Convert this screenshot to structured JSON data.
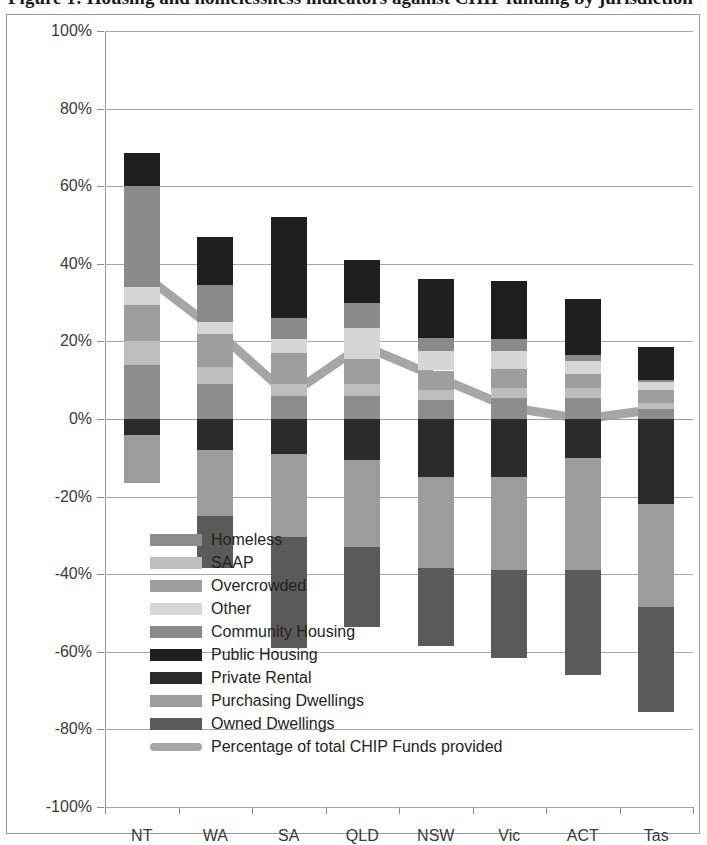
{
  "title": "Figure 1: Housing and homelessness indicators against CHIP funding by jurisdiction",
  "chart_data": {
    "type": "bar",
    "subtype": "stacked-bar-with-line",
    "title": "Housing and homelessness indicators against CHIP funding by jurisdiction",
    "xlabel": "",
    "ylabel": "",
    "ylim": [
      -100,
      100
    ],
    "ytick_values": [
      100,
      80,
      60,
      40,
      20,
      0,
      -20,
      -40,
      -60,
      -80,
      -100
    ],
    "ytick_labels": [
      "100%",
      "80%",
      "60%",
      "40%",
      "20%",
      "0%",
      "-20%",
      "-40%",
      "-60%",
      "-80%",
      "-100%"
    ],
    "grid": true,
    "legend_position": "inside-lower-left",
    "categories": [
      "NT",
      "WA",
      "SA",
      "QLD",
      "NSW",
      "Vic",
      "ACT",
      "Tas"
    ],
    "series": [
      {
        "name": "Homeless",
        "color": "#8c8c8c",
        "values": [
          14.0,
          9.0,
          6.0,
          6.0,
          5.0,
          5.5,
          5.5,
          2.5
        ]
      },
      {
        "name": "SAAP",
        "color": "#bdbdbd",
        "values": [
          6.0,
          4.5,
          3.0,
          3.0,
          2.5,
          2.5,
          2.5,
          1.5
        ]
      },
      {
        "name": "Overcrowded",
        "color": "#9e9e9e",
        "values": [
          9.5,
          8.5,
          8.0,
          6.5,
          5.0,
          5.0,
          3.5,
          3.5
        ]
      },
      {
        "name": "Other",
        "color": "#d6d6d6",
        "values": [
          4.5,
          3.0,
          3.5,
          8.0,
          5.0,
          4.5,
          3.5,
          2.0
        ]
      },
      {
        "name": "Community Housing",
        "color": "#8a8a8a",
        "values": [
          26.0,
          9.5,
          5.5,
          6.5,
          3.5,
          3.0,
          1.5,
          0.5
        ]
      },
      {
        "name": "Public Housing",
        "color": "#1f1f1f",
        "values": [
          8.5,
          12.5,
          26.0,
          11.0,
          15.0,
          15.0,
          14.5,
          8.5
        ]
      },
      {
        "name": "Private Rental",
        "color": "#2b2b2b",
        "values": [
          -4.0,
          -8.0,
          -9.0,
          -10.5,
          -15.0,
          -15.0,
          -10.0,
          -22.0
        ]
      },
      {
        "name": "Purchasing Dwellings",
        "color": "#9c9c9c",
        "values": [
          -12.5,
          -17.0,
          -21.5,
          -22.5,
          -23.5,
          -24.0,
          -29.0,
          -26.5
        ]
      },
      {
        "name": "Owned Dwellings",
        "color": "#5a5a5a",
        "values": [
          0.0,
          -13.5,
          -28.5,
          -20.5,
          -20.0,
          -22.5,
          -27.0,
          -27.0
        ]
      }
    ],
    "line_series": {
      "name": "Percentage of total CHIP Funds provided",
      "color": "#a6a6a6",
      "values": [
        37.5,
        23.0,
        6.0,
        19.0,
        11.0,
        3.0,
        0.0,
        2.5
      ]
    }
  },
  "legend": {
    "items": [
      {
        "label": "Homeless",
        "color": "#8c8c8c",
        "type": "box"
      },
      {
        "label": "SAAP",
        "color": "#bdbdbd",
        "type": "box"
      },
      {
        "label": "Overcrowded",
        "color": "#9e9e9e",
        "type": "box"
      },
      {
        "label": "Other",
        "color": "#d6d6d6",
        "type": "box"
      },
      {
        "label": "Community Housing",
        "color": "#8a8a8a",
        "type": "box"
      },
      {
        "label": "Public Housing",
        "color": "#1f1f1f",
        "type": "box"
      },
      {
        "label": "Private Rental",
        "color": "#2b2b2b",
        "type": "box"
      },
      {
        "label": "Purchasing Dwellings",
        "color": "#9c9c9c",
        "type": "box"
      },
      {
        "label": "Owned Dwellings",
        "color": "#5a5a5a",
        "type": "box"
      },
      {
        "label": "Percentage of total CHIP Funds provided",
        "color": "#a6a6a6",
        "type": "line"
      }
    ]
  }
}
